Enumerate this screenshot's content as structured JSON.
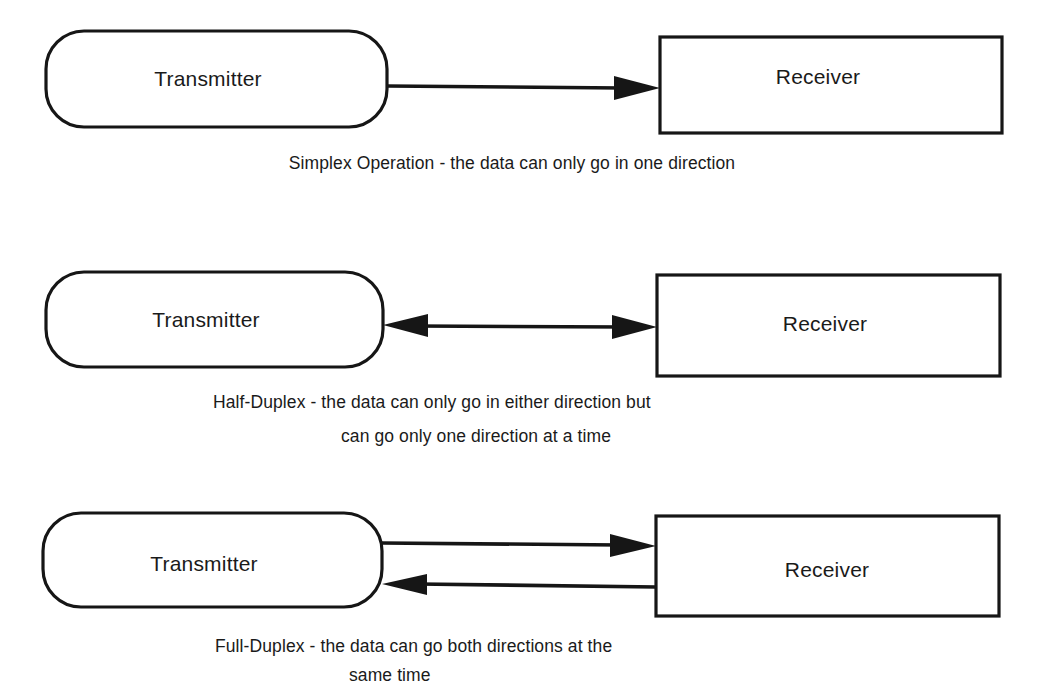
{
  "diagrams": [
    {
      "mode": "simplex",
      "transmitter": {
        "label": "Transmitter"
      },
      "receiver": {
        "label": "Receiver"
      },
      "connection": "one-way arrow from Transmitter to Receiver",
      "caption": [
        "Simplex Operation - the data can only go in one direction"
      ]
    },
    {
      "mode": "half-duplex",
      "transmitter": {
        "label": "Transmitter"
      },
      "receiver": {
        "label": "Receiver"
      },
      "connection": "single double-headed arrow between Transmitter and Receiver",
      "caption": [
        "Half-Duplex - the data can only go in either direction but",
        "can go only one direction at a time"
      ]
    },
    {
      "mode": "full-duplex",
      "transmitter": {
        "label": "Transmitter"
      },
      "receiver": {
        "label": "Receiver"
      },
      "connection": "two separate arrows: Transmitter to Receiver (top) and Receiver to Transmitter (bottom)",
      "caption": [
        "Full-Duplex - the data can go both directions at the",
        "same time"
      ]
    }
  ],
  "colors": {
    "stroke": "#161616",
    "text": "#1a1a1a",
    "background": "#ffffff"
  }
}
